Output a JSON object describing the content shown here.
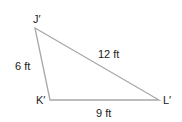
{
  "diagram": {
    "type": "triangle",
    "vertices": {
      "J": {
        "label": "J′",
        "x": 35,
        "y": 28
      },
      "K": {
        "label": "K′",
        "x": 50,
        "y": 100
      },
      "L": {
        "label": "L′",
        "x": 159,
        "y": 100
      }
    },
    "sides": {
      "JK": {
        "label": "6 ft"
      },
      "JL": {
        "label": "12 ft"
      },
      "KL": {
        "label": "9 ft"
      }
    },
    "line_color": "#a8a8a8",
    "text_color": "#222222"
  }
}
